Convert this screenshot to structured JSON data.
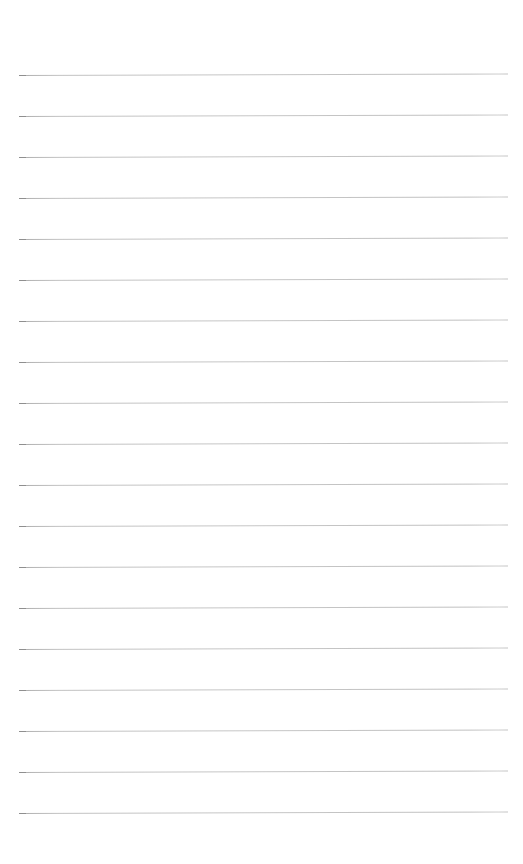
{
  "document": {
    "kind": "scanned-blank-ruled-page",
    "page_width": 523,
    "page_height": 864,
    "background_color": "#ffffff",
    "has_text": false,
    "visible_text": "",
    "margin_rule": false,
    "holes": false
  },
  "ruling": {
    "line_color": "#c2c2c2",
    "line_color_dark_end": "#9a9a9a",
    "line_thickness_px": 1,
    "line_count": 19,
    "left_x_px": 19,
    "right_x_px": 508,
    "line_length_px": 489,
    "first_line_y_px": 75,
    "line_spacing_px": 41,
    "skew_degrees": -0.18,
    "lines_y_px": [
      75,
      116,
      157,
      198,
      239,
      280,
      321,
      362,
      403,
      444,
      485,
      526,
      567,
      608,
      649,
      690,
      731,
      772,
      813
    ]
  },
  "margins": {
    "top_blank_px": 75,
    "bottom_blank_px": 51,
    "left_px": 19,
    "right_px": 15
  }
}
